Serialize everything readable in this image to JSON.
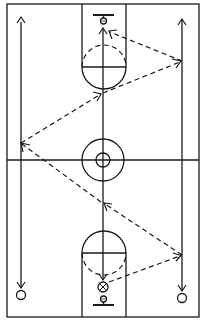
{
  "diagram": {
    "type": "basketball-drill",
    "colors": {
      "ink": "#1a1a1a",
      "background": "#ffffff"
    },
    "court": {
      "boundary": {
        "x": 7,
        "y": 4,
        "width": 192,
        "height": 313
      },
      "midline_y": 160,
      "center_circle": {
        "cx": 103,
        "cy": 160,
        "r_outer": 21,
        "r_inner": 7
      },
      "top_key": {
        "lane_left": 82,
        "lane_right": 126,
        "free_throw_y": 67,
        "arc_radius": 22
      },
      "bottom_key": {
        "lane_left": 82,
        "lane_right": 126,
        "free_throw_y": 253,
        "arc_radius": 22
      },
      "top_basket": {
        "backboard_y": 15,
        "hoop_cy": 21
      },
      "bottom_basket": {
        "backboard_y": 305,
        "hoop_cy": 299
      }
    },
    "players": [
      {
        "id": "left-player",
        "symbol": "circle",
        "cx": 21,
        "cy": 295
      },
      {
        "id": "right-player",
        "symbol": "circle",
        "cx": 182,
        "cy": 298
      },
      {
        "id": "ball-handler",
        "symbol": "circle-x",
        "cx": 103,
        "cy": 286
      }
    ],
    "movements": [
      {
        "id": "left-run",
        "style": "solid",
        "from": [
          21,
          290
        ],
        "to": [
          21,
          22
        ]
      },
      {
        "id": "right-run",
        "style": "solid",
        "from": [
          182,
          293
        ],
        "to": [
          182,
          18
        ]
      },
      {
        "id": "center-run",
        "style": "solid",
        "from": [
          103,
          281
        ],
        "to": [
          103,
          28
        ]
      }
    ],
    "passes": [
      {
        "from": [
          108,
          283
        ],
        "to": [
          182,
          255
        ]
      },
      {
        "from": [
          182,
          255
        ],
        "to": [
          103,
          203
        ]
      },
      {
        "from": [
          103,
          203
        ],
        "to": [
          21,
          143
        ]
      },
      {
        "from": [
          21,
          143
        ],
        "to": [
          103,
          93
        ]
      },
      {
        "from": [
          103,
          93
        ],
        "to": [
          182,
          61
        ]
      },
      {
        "from": [
          182,
          61
        ],
        "to": [
          108,
          31
        ]
      }
    ],
    "labels": {
      "title": "Three-lane passing drill"
    }
  }
}
